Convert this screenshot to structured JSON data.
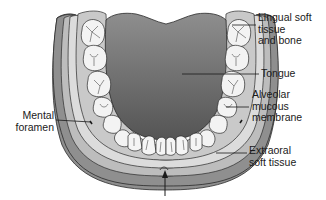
{
  "figure": {
    "labels": [
      {
        "id": "lingual",
        "text": "Lingual soft\ntissue\nand bone"
      },
      {
        "id": "tongue",
        "text": "Tongue"
      },
      {
        "id": "mental",
        "text": "Mental\nforamen"
      },
      {
        "id": "alveolar",
        "text": "Alveolar\nmucous\nmembrane"
      },
      {
        "id": "extraoral",
        "text": "Extraoral\nsoft tissue"
      }
    ],
    "arrow": {
      "direction": "up",
      "position": "bottom-center"
    },
    "colors": {
      "extraoral": "#8c8c8c",
      "bone_band": "#c4c4c4",
      "mucosa": "#d9d9d9",
      "alveolar": "#b5b5b5",
      "tongue_top": "#8a8a8a",
      "tongue_bottom": "#4f4f4f",
      "tooth": "#f4f4f4",
      "outline": "#2a2a2a"
    }
  }
}
